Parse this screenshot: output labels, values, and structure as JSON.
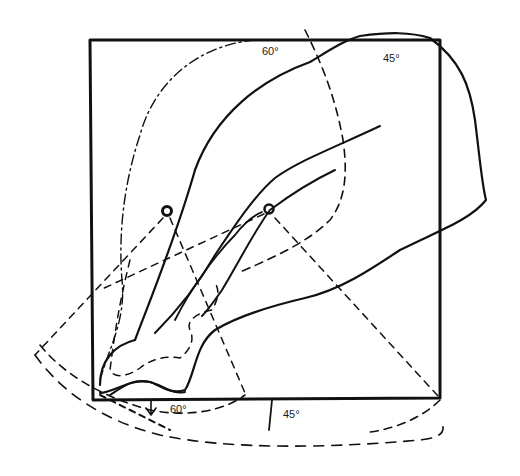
{
  "figure": {
    "type": "line-drawing",
    "stroke_color": "#111111",
    "background": "#ffffff"
  },
  "labels": {
    "top_60": "60°",
    "top_45": "45°",
    "bottom_60": "60°",
    "bottom_45": "45°"
  },
  "markers": [
    {
      "name": "pivot-left",
      "x": 167,
      "y": 211
    },
    {
      "name": "pivot-right",
      "x": 269,
      "y": 209
    }
  ]
}
